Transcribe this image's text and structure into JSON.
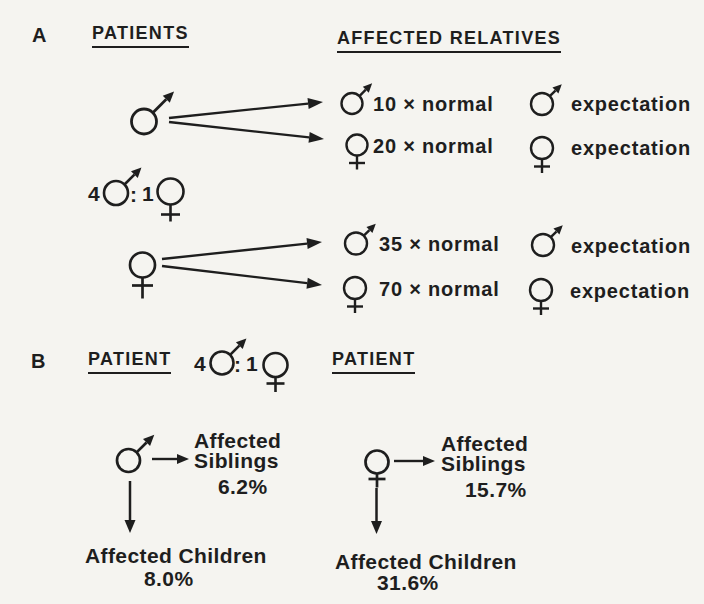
{
  "figure": {
    "background_color": "#f5f4f0",
    "ink_color": "#1e1e1e"
  },
  "icons": {
    "male_symbol": "♂",
    "female_symbol": "♀"
  },
  "section_a": {
    "label": "A",
    "patients_header": "PATIENTS",
    "relatives_header": "AFFECTED RELATIVES",
    "ratio": {
      "male_count": "4",
      "separator": ":",
      "female_count": "1"
    },
    "male_patient": {
      "patient_sex": "male",
      "rows": [
        {
          "relative_sex": "male",
          "rate": "10 × normal",
          "expectation_sex": "male",
          "expectation_label": "expectation"
        },
        {
          "relative_sex": "female",
          "rate": "20 × normal",
          "expectation_sex": "female",
          "expectation_label": "expectation"
        }
      ]
    },
    "female_patient": {
      "patient_sex": "female",
      "rows": [
        {
          "relative_sex": "male",
          "rate": "35 × normal",
          "expectation_sex": "male",
          "expectation_label": "expectation"
        },
        {
          "relative_sex": "female",
          "rate": "70 × normal",
          "expectation_sex": "female",
          "expectation_label": "expectation"
        }
      ]
    }
  },
  "section_b": {
    "label": "B",
    "patient_left_header": "PATIENT",
    "patient_right_header": "PATIENT",
    "ratio": {
      "male_count": "4",
      "separator": ":",
      "female_count": "1"
    },
    "male_patient": {
      "patient_sex": "male",
      "siblings_label_line1": "Affected",
      "siblings_label_line2": "Siblings",
      "siblings_pct": "6.2%",
      "children_label": "Affected Children",
      "children_pct": "8.0%"
    },
    "female_patient": {
      "patient_sex": "female",
      "siblings_label_line1": "Affected",
      "siblings_label_line2": "Siblings",
      "siblings_pct": "15.7%",
      "children_label": "Affected Children",
      "children_pct": "31.6%"
    }
  }
}
